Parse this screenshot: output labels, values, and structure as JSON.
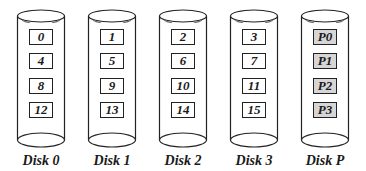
{
  "disks": [
    {
      "label": "Disk 0",
      "blocks": [
        "0",
        "4",
        "8",
        "12"
      ],
      "parity": false
    },
    {
      "label": "Disk 1",
      "blocks": [
        "1",
        "5",
        "9",
        "13"
      ],
      "parity": false
    },
    {
      "label": "Disk 2",
      "blocks": [
        "2",
        "6",
        "10",
        "14"
      ],
      "parity": false
    },
    {
      "label": "Disk 3",
      "blocks": [
        "3",
        "7",
        "11",
        "15"
      ],
      "parity": false
    },
    {
      "label": "Disk P",
      "blocks": [
        "P0",
        "P1",
        "P2",
        "P3"
      ],
      "parity": true
    }
  ],
  "colors": {
    "stroke": "#222222",
    "parity_fill": "#d6d6d6",
    "block_fill": "#ffffff"
  }
}
